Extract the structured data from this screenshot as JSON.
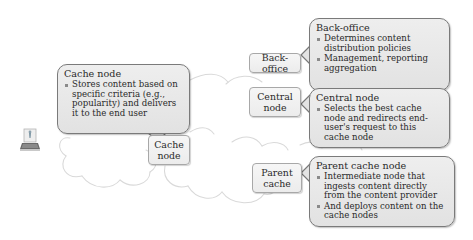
{
  "diagram": {
    "end_user": {
      "icon": "user-laptop-icon"
    },
    "cache_node_callout": {
      "title": "Cache node",
      "bullets": [
        "Stores content based on specific criteria (e.g., popularity) and delivers it to the end user"
      ]
    },
    "cache_node_label": {
      "line1": "Cache",
      "line2": "node"
    },
    "back_office_label": {
      "line1": "Back-office"
    },
    "back_office_callout": {
      "title": "Back-office",
      "bullets": [
        "Determines content distribution policies",
        "Management, reporting aggregation"
      ]
    },
    "central_node_label": {
      "line1": "Central",
      "line2": "node"
    },
    "central_node_callout": {
      "title": "Central node",
      "bullets": [
        "Selects the best cache node and redirects end-user's request to this cache node"
      ]
    },
    "parent_cache_label": {
      "line1": "Parent",
      "line2": "cache"
    },
    "parent_cache_callout": {
      "title": "Parent cache node",
      "bullets": [
        "Intermediate node that ingests  content directly from the content provider",
        "And deploys content on the cache nodes"
      ]
    },
    "colors": {
      "callout_fill": "#e6e6e6",
      "callout_border": "#7a7a7a",
      "label_fill": "#f0f0f0",
      "label_border": "#a8a8a8",
      "cloud_stroke": "#d8d8d8"
    }
  }
}
